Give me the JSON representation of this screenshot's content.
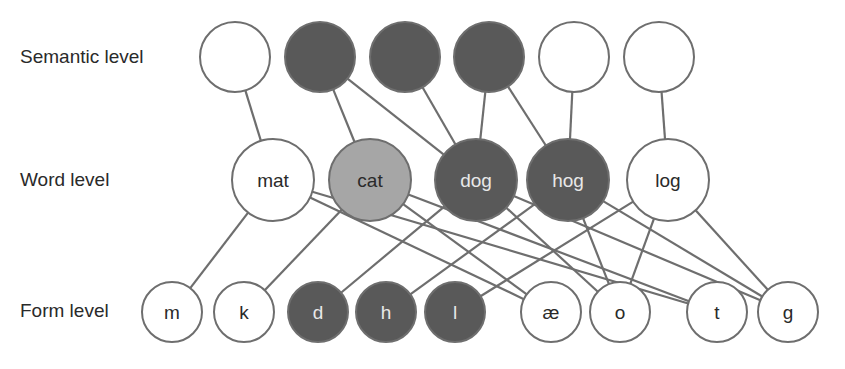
{
  "colors": {
    "edge": "#6e6e6e",
    "inactive_fill": "#ffffff",
    "active_fill": "#595959",
    "partial_fill": "#a6a6a6",
    "text_dark": "#2a2a2a",
    "text_light": "#e8e8e8"
  },
  "levels": {
    "semantic": {
      "label": "Semantic level",
      "x": 20,
      "y": 46
    },
    "word": {
      "label": "Word level",
      "x": 20,
      "y": 169
    },
    "form": {
      "label": "Form level",
      "x": 20,
      "y": 300
    }
  },
  "nodes": {
    "semantic": [
      {
        "id": "s1",
        "label": "",
        "cx": 235,
        "cy": 57,
        "r": 35,
        "state": "inactive"
      },
      {
        "id": "s2",
        "label": "",
        "cx": 320,
        "cy": 57,
        "r": 35,
        "state": "active"
      },
      {
        "id": "s3",
        "label": "",
        "cx": 405,
        "cy": 57,
        "r": 35,
        "state": "active"
      },
      {
        "id": "s4",
        "label": "",
        "cx": 489,
        "cy": 57,
        "r": 35,
        "state": "active"
      },
      {
        "id": "s5",
        "label": "",
        "cx": 574,
        "cy": 57,
        "r": 35,
        "state": "inactive"
      },
      {
        "id": "s6",
        "label": "",
        "cx": 659,
        "cy": 57,
        "r": 35,
        "state": "inactive"
      }
    ],
    "word": [
      {
        "id": "mat",
        "label": "mat",
        "cx": 273,
        "cy": 180,
        "r": 41,
        "state": "inactive"
      },
      {
        "id": "cat",
        "label": "cat",
        "cx": 370,
        "cy": 180,
        "r": 41,
        "state": "partial"
      },
      {
        "id": "dog",
        "label": "dog",
        "cx": 476,
        "cy": 180,
        "r": 41,
        "state": "active"
      },
      {
        "id": "hog",
        "label": "hog",
        "cx": 568,
        "cy": 180,
        "r": 41,
        "state": "active"
      },
      {
        "id": "log",
        "label": "log",
        "cx": 668,
        "cy": 180,
        "r": 41,
        "state": "inactive"
      }
    ],
    "form": [
      {
        "id": "m",
        "label": "m",
        "cx": 172,
        "cy": 312,
        "r": 30,
        "state": "inactive"
      },
      {
        "id": "k",
        "label": "k",
        "cx": 244,
        "cy": 312,
        "r": 30,
        "state": "inactive"
      },
      {
        "id": "d",
        "label": "d",
        "cx": 318,
        "cy": 312,
        "r": 30,
        "state": "active"
      },
      {
        "id": "h",
        "label": "h",
        "cx": 386,
        "cy": 312,
        "r": 30,
        "state": "active"
      },
      {
        "id": "l",
        "label": "l",
        "cx": 455,
        "cy": 312,
        "r": 30,
        "state": "active"
      },
      {
        "id": "ae",
        "label": "æ",
        "cx": 551,
        "cy": 312,
        "r": 30,
        "state": "inactive"
      },
      {
        "id": "o",
        "label": "o",
        "cx": 620,
        "cy": 312,
        "r": 30,
        "state": "inactive"
      },
      {
        "id": "t",
        "label": "t",
        "cx": 717,
        "cy": 312,
        "r": 30,
        "state": "inactive"
      },
      {
        "id": "g",
        "label": "g",
        "cx": 788,
        "cy": 312,
        "r": 30,
        "state": "inactive"
      }
    ]
  },
  "edges": [
    [
      "s1",
      "mat"
    ],
    [
      "s2",
      "cat"
    ],
    [
      "s2",
      "dog"
    ],
    [
      "s3",
      "dog"
    ],
    [
      "s4",
      "dog"
    ],
    [
      "s4",
      "hog"
    ],
    [
      "s5",
      "hog"
    ],
    [
      "s6",
      "log"
    ],
    [
      "mat",
      "m"
    ],
    [
      "mat",
      "ae"
    ],
    [
      "mat",
      "t"
    ],
    [
      "cat",
      "k"
    ],
    [
      "cat",
      "ae"
    ],
    [
      "cat",
      "t"
    ],
    [
      "dog",
      "d"
    ],
    [
      "dog",
      "o"
    ],
    [
      "dog",
      "g"
    ],
    [
      "hog",
      "h"
    ],
    [
      "hog",
      "o"
    ],
    [
      "hog",
      "g"
    ],
    [
      "log",
      "l"
    ],
    [
      "log",
      "o"
    ],
    [
      "log",
      "g"
    ]
  ]
}
